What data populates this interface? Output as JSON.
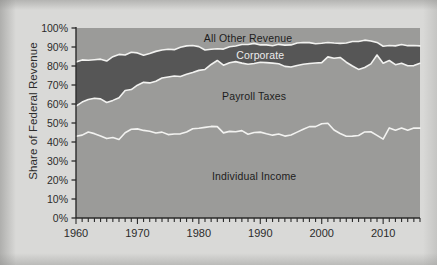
{
  "chart_data": {
    "type": "area",
    "title": "",
    "subtitle": "",
    "xlabel": "",
    "ylabel": "Share of Federal Revenue",
    "stacked": true,
    "normalized_percent": true,
    "grid": false,
    "legend_position": "inline-area-labels",
    "xlim": [
      1960,
      2016
    ],
    "ylim": [
      0,
      100
    ],
    "y_tick_labels": [
      "100%",
      "90%",
      "80%",
      "70%",
      "60%",
      "50%",
      "40%",
      "30%",
      "20%",
      "10%",
      "0%"
    ],
    "y_tick_values": [
      100,
      90,
      80,
      70,
      60,
      50,
      40,
      30,
      20,
      10,
      0
    ],
    "x_tick_labels": [
      "1960",
      "1970",
      "1980",
      "1990",
      "2000",
      "2010"
    ],
    "x_tick_values": [
      1960,
      1970,
      1980,
      1990,
      2000,
      2010
    ],
    "x_minor_tick_interval": 1,
    "colors": {
      "individual_income": "#9b9b99",
      "payroll_taxes": "#9b9b99",
      "corporate": "#565656",
      "all_other_revenue": "#9b9b99",
      "boundary_line": "#f2f2f0",
      "axis": "#2b2b2b",
      "plot_background": "#9b9b99",
      "page_background": "#d9d9d7"
    },
    "x": [
      1960,
      1961,
      1962,
      1963,
      1964,
      1965,
      1966,
      1967,
      1968,
      1969,
      1970,
      1971,
      1972,
      1973,
      1974,
      1975,
      1976,
      1977,
      1978,
      1979,
      1980,
      1981,
      1982,
      1983,
      1984,
      1985,
      1986,
      1987,
      1988,
      1989,
      1990,
      1991,
      1992,
      1993,
      1994,
      1995,
      1996,
      1997,
      1998,
      1999,
      2000,
      2001,
      2002,
      2003,
      2004,
      2005,
      2006,
      2007,
      2008,
      2009,
      2010,
      2011,
      2012,
      2013,
      2014,
      2015,
      2016
    ],
    "series": [
      {
        "name": "Individual Income",
        "label": "Individual Income",
        "label_color": "dark",
        "values": [
          43.0,
          43.6,
          45.3,
          44.4,
          43.2,
          41.8,
          42.4,
          41.3,
          44.9,
          46.7,
          46.9,
          46.1,
          45.7,
          44.7,
          45.2,
          43.9,
          44.2,
          44.3,
          45.3,
          47.0,
          47.2,
          47.7,
          48.2,
          48.1,
          44.8,
          45.6,
          45.4,
          46.0,
          44.1,
          45.0,
          45.2,
          44.3,
          43.6,
          44.2,
          43.1,
          43.7,
          45.2,
          46.7,
          48.1,
          48.1,
          49.6,
          49.9,
          46.3,
          44.5,
          43.0,
          43.1,
          43.4,
          45.3,
          45.4,
          43.5,
          41.5,
          47.4,
          46.2,
          47.4,
          46.2,
          47.4,
          47.3
        ]
      },
      {
        "name": "Payroll Taxes",
        "label": "Payroll Taxes",
        "label_color": "dark",
        "values": [
          15.9,
          17.4,
          17.1,
          18.6,
          19.5,
          19.0,
          19.5,
          22.0,
          22.2,
          20.9,
          23.0,
          25.3,
          25.4,
          27.3,
          28.5,
          30.3,
          30.5,
          30.2,
          30.3,
          29.6,
          30.5,
          30.5,
          32.6,
          34.8,
          35.6,
          36.1,
          36.9,
          35.5,
          36.8,
          36.3,
          36.8,
          37.5,
          37.9,
          37.0,
          36.7,
          35.8,
          35.1,
          34.2,
          33.2,
          33.5,
          32.2,
          34.9,
          37.8,
          40.0,
          39.0,
          36.9,
          34.8,
          33.9,
          35.7,
          42.3,
          40.0,
          35.5,
          34.5,
          34.0,
          33.9,
          32.8,
          34.1
        ]
      },
      {
        "name": "Corporate",
        "label": "Corporate",
        "label_color": "light",
        "values": [
          23.2,
          22.2,
          20.6,
          20.3,
          20.9,
          21.8,
          23.0,
          22.8,
          18.7,
          19.6,
          17.0,
          14.3,
          15.5,
          15.7,
          14.7,
          14.6,
          13.9,
          15.4,
          15.0,
          14.2,
          12.5,
          10.2,
          8.0,
          6.2,
          8.5,
          8.4,
          8.2,
          9.8,
          10.4,
          10.6,
          9.1,
          9.3,
          9.2,
          10.2,
          11.2,
          11.6,
          11.8,
          11.5,
          11.0,
          10.1,
          10.2,
          7.6,
          8.0,
          7.4,
          10.1,
          12.9,
          14.7,
          14.4,
          12.1,
          6.6,
          8.9,
          7.9,
          9.9,
          9.9,
          10.6,
          10.6,
          9.2
        ]
      },
      {
        "name": "All Other Revenue",
        "label": "All Other Revenue",
        "label_color": "dark",
        "values": [
          17.9,
          16.8,
          17.0,
          16.7,
          16.4,
          17.4,
          15.1,
          13.9,
          14.2,
          12.8,
          13.1,
          14.3,
          13.4,
          12.3,
          11.6,
          11.2,
          11.4,
          10.1,
          9.4,
          9.2,
          9.8,
          11.6,
          11.2,
          10.9,
          11.1,
          9.9,
          9.5,
          8.7,
          8.7,
          8.1,
          8.9,
          8.9,
          9.3,
          8.6,
          9.0,
          8.9,
          7.9,
          7.6,
          7.7,
          8.3,
          8.0,
          7.6,
          7.9,
          8.1,
          7.9,
          7.1,
          7.1,
          6.4,
          6.8,
          7.6,
          9.6,
          9.2,
          9.4,
          8.7,
          9.3,
          9.2,
          9.4
        ]
      }
    ],
    "area_labels": [
      {
        "text": "All Other Revenue",
        "x": 1988,
        "y": 94.5,
        "color": "dark"
      },
      {
        "text": "Corporate",
        "x": 1990,
        "y": 86.0,
        "color": "light"
      },
      {
        "text": "Payroll Taxes",
        "x": 1989,
        "y": 64.0,
        "color": "dark"
      },
      {
        "text": "Individual Income",
        "x": 1989,
        "y": 22.0,
        "color": "dark"
      }
    ]
  }
}
